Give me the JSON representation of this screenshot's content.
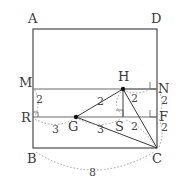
{
  "diagram": {
    "type": "geometry-figure",
    "stroke_color": "#4a4a4a",
    "dash_color": "#9a9a9a",
    "point_color": "#111111",
    "vertices": [
      {
        "name": "A",
        "label": "A",
        "x": 33,
        "y": 29
      },
      {
        "name": "D",
        "label": "D",
        "x": 157,
        "y": 29
      },
      {
        "name": "B",
        "label": "B",
        "x": 33,
        "y": 148
      },
      {
        "name": "C",
        "label": "C",
        "x": 157,
        "y": 148
      },
      {
        "name": "M",
        "label": "M",
        "x": 33,
        "y": 89
      },
      {
        "name": "N",
        "label": "N",
        "x": 157,
        "y": 89
      },
      {
        "name": "R",
        "label": "R",
        "x": 33,
        "y": 117
      },
      {
        "name": "F",
        "label": "F",
        "x": 157,
        "y": 117
      },
      {
        "name": "H",
        "label": "H",
        "x": 123,
        "y": 89
      },
      {
        "name": "G",
        "label": "G",
        "x": 76,
        "y": 117
      },
      {
        "name": "S",
        "label": "S",
        "x": 123,
        "y": 117
      }
    ],
    "measures": [
      {
        "name": "MR",
        "label": "2",
        "x": 38,
        "y": 98
      },
      {
        "name": "GH-left",
        "label": "2",
        "x": 100,
        "y": 100
      },
      {
        "name": "HN",
        "label": "2",
        "x": 134,
        "y": 98
      },
      {
        "name": "NF",
        "label": "2",
        "x": 163,
        "y": 98
      },
      {
        "name": "FC",
        "label": "2",
        "x": 163,
        "y": 126
      },
      {
        "name": "SC",
        "label": "2",
        "x": 134,
        "y": 126
      },
      {
        "name": "RG",
        "label": "3",
        "x": 55,
        "y": 128
      },
      {
        "name": "GS",
        "label": "3",
        "x": 100,
        "y": 128
      },
      {
        "name": "BC",
        "label": "8",
        "x": 92,
        "y": 174
      }
    ]
  }
}
